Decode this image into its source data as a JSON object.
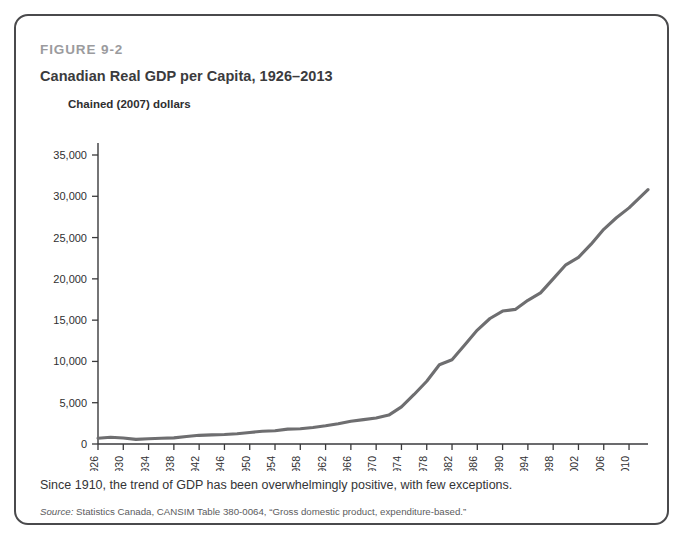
{
  "figure": {
    "number": "FIGURE 9-2",
    "title": "Canadian Real GDP per Capita, 1926–2013",
    "unit_label": "Chained (2007) dollars",
    "caption": "Since 1910, the trend of GDP has been overwhelmingly positive, with few exceptions.",
    "source_prefix": "Source:",
    "source_text": " Statistics Canada, CANSIM Table 380-0064, “Gross domestic product, expenditure-based.”",
    "border_color": "#4a4a4c",
    "line_color": "#6e6e70",
    "axis_color": "#3a3a3c"
  },
  "chart_data": {
    "type": "line",
    "title": "Canadian Real GDP per Capita, 1926–2013",
    "xlabel": "",
    "ylabel": "Chained (2007) dollars",
    "xlim": [
      1926,
      2013
    ],
    "ylim": [
      0,
      35000
    ],
    "grid": false,
    "legend": "none",
    "ytick_labels": [
      "0",
      "5,000",
      "10,000",
      "15,000",
      "20,000",
      "25,000",
      "30,000",
      "35,000"
    ],
    "ytick_values": [
      0,
      5000,
      10000,
      15000,
      20000,
      25000,
      30000,
      35000
    ],
    "xtick_labels": [
      "1926",
      "1930",
      "1934",
      "1938",
      "1942",
      "1946",
      "1950",
      "1954",
      "1958",
      "1962",
      "1966",
      "1970",
      "1974",
      "1978",
      "1982",
      "1986",
      "1990",
      "1994",
      "1998",
      "2002",
      "2006",
      "2010"
    ],
    "xtick_values": [
      1926,
      1930,
      1934,
      1938,
      1942,
      1946,
      1950,
      1954,
      1958,
      1962,
      1966,
      1970,
      1974,
      1978,
      1982,
      1986,
      1990,
      1994,
      1998,
      2002,
      2006,
      2010
    ],
    "series": [
      {
        "name": "Real GDP per capita",
        "x": [
          1926,
          1928,
          1930,
          1932,
          1934,
          1936,
          1938,
          1940,
          1942,
          1944,
          1946,
          1948,
          1950,
          1952,
          1954,
          1956,
          1958,
          1960,
          1962,
          1964,
          1966,
          1968,
          1970,
          1972,
          1974,
          1976,
          1978,
          1980,
          1982,
          1984,
          1986,
          1988,
          1990,
          1992,
          1994,
          1996,
          1998,
          2000,
          2002,
          2004,
          2006,
          2008,
          2010,
          2013
        ],
        "values": [
          700,
          820,
          720,
          560,
          640,
          700,
          740,
          900,
          1050,
          1100,
          1150,
          1250,
          1400,
          1550,
          1600,
          1800,
          1850,
          2000,
          2200,
          2450,
          2750,
          2950,
          3150,
          3500,
          4500,
          6000,
          7600,
          9600,
          10200,
          12000,
          13800,
          15200,
          16100,
          16300,
          17400,
          18300,
          20000,
          21700,
          22600,
          24200,
          26000,
          27400,
          28600,
          30800
        ]
      }
    ]
  }
}
